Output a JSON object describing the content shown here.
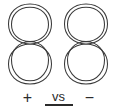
{
  "diagram": {
    "type": "polarity-comparison",
    "background_color": "#ffffff",
    "stroke_color": "#3a3a3a",
    "text_color": "#2b2b2b",
    "coils": [
      {
        "id": "left",
        "shape": "figure-eight-double-loop",
        "turns": 2,
        "polarity_label": "+"
      },
      {
        "id": "right",
        "shape": "figure-eight-double-loop",
        "turns": 2,
        "polarity_label": "−"
      }
    ],
    "labels": {
      "left_polarity": "+",
      "comparator": "vs",
      "right_polarity": "−"
    }
  }
}
